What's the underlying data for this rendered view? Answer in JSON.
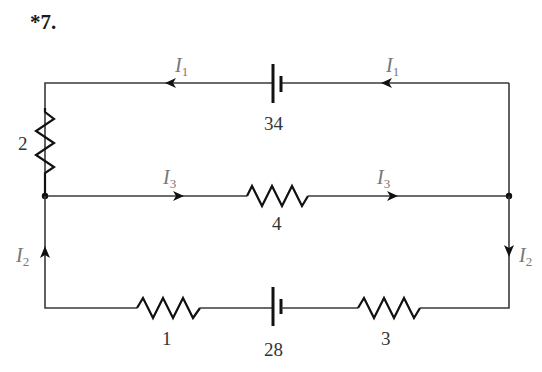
{
  "problem": {
    "number": "*7."
  },
  "components": {
    "battery_top": {
      "value": "34"
    },
    "battery_bottom": {
      "value": "28"
    },
    "resistor_left": {
      "value": "2"
    },
    "resistor_middle": {
      "value": "4"
    },
    "resistor_bottom_left": {
      "value": "1"
    },
    "resistor_bottom_right": {
      "value": "3"
    }
  },
  "currents": {
    "top_left": {
      "symbol": "I",
      "sub": "1"
    },
    "top_right": {
      "symbol": "I",
      "sub": "1"
    },
    "mid_left": {
      "symbol": "I",
      "sub": "3"
    },
    "mid_right": {
      "symbol": "I",
      "sub": "3"
    },
    "left": {
      "symbol": "I",
      "sub": "2"
    },
    "right": {
      "symbol": "I",
      "sub": "2"
    }
  },
  "colors": {
    "wire": "#3a3a3a",
    "component": "#111111",
    "current_label": "#777777"
  }
}
